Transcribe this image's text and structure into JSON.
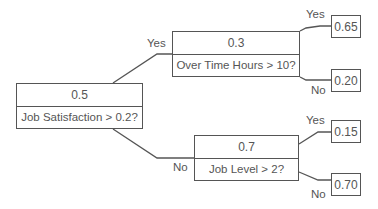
{
  "tree": {
    "root": {
      "value": "0.5",
      "question": "Job Satisfaction > 0.2?"
    },
    "yes_node": {
      "value": "0.3",
      "question": "Over Time Hours > 10?"
    },
    "no_node": {
      "value": "0.7",
      "question": "Job Level > 2?"
    },
    "leaves": {
      "yes_yes": "0.65",
      "yes_no": "0.20",
      "no_yes": "0.15",
      "no_no": "0.70"
    },
    "labels": {
      "yes": "Yes",
      "no": "No"
    }
  },
  "colors": {
    "line": "#555555",
    "text": "#555555",
    "background": "#ffffff"
  }
}
